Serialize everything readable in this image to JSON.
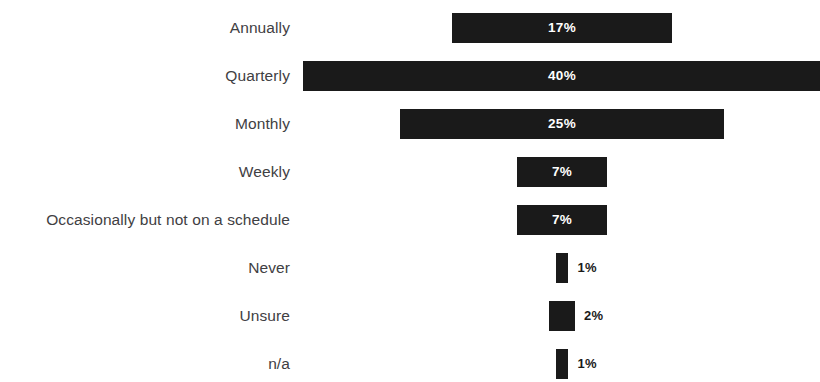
{
  "chart_data": {
    "type": "bar",
    "orientation": "horizontal",
    "title": "",
    "subtitle": "",
    "xlabel": "",
    "ylabel": "",
    "grid": false,
    "legend": false,
    "legend_position": "none",
    "axis_visible": false,
    "bar_alignment": "centered",
    "value_suffix": "%",
    "xlim": [
      0,
      40
    ],
    "categories": [
      "Annually",
      "Quarterly",
      "Monthly",
      "Weekly",
      "Occasionally but not on a schedule",
      "Never",
      "Unsure",
      "n/a"
    ],
    "values": [
      17,
      40,
      25,
      7,
      7,
      1,
      2,
      1
    ],
    "labels": [
      "17%",
      "40%",
      "25%",
      "7%",
      "7%",
      "1%",
      "2%",
      "1%"
    ],
    "label_placement": [
      "inside",
      "inside",
      "inside",
      "inside",
      "inside",
      "outside",
      "outside",
      "outside"
    ],
    "colors": {
      "bar": "#1a1a1a",
      "background": "#ffffff",
      "category_text": "#3f4043",
      "value_inside_text": "#ffffff",
      "value_outside_text": "#1a1a1a"
    }
  }
}
